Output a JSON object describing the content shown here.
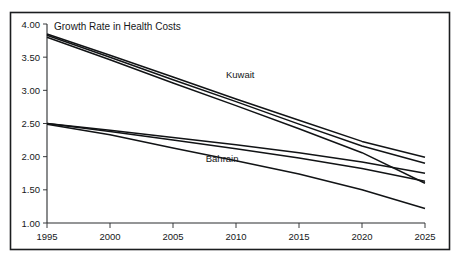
{
  "figure": {
    "title": "Growth Rate in Health Costs",
    "frame": {
      "border_color": "#1b1d1f"
    },
    "labels": {
      "kuwait": "Kuwait",
      "bahrain": "Bahrain"
    }
  },
  "chart_data": {
    "type": "line",
    "title": "Growth Rate in Health Costs",
    "xlabel": "",
    "ylabel": "",
    "xlim": [
      1995,
      2025
    ],
    "ylim": [
      1.0,
      4.0
    ],
    "grid": false,
    "legend": "inline-annotations",
    "x": [
      1995,
      2000,
      2005,
      2010,
      2015,
      2020,
      2025
    ],
    "xticklabels": [
      "1995",
      "2000",
      "2005",
      "2010",
      "2015",
      "2020",
      "2025"
    ],
    "yticks": [
      1.0,
      1.5,
      2.0,
      2.5,
      3.0,
      3.5,
      4.0
    ],
    "yticklabels": [
      "1.00",
      "1.50",
      "2.00",
      "2.50",
      "3.00",
      "3.50",
      "4.00"
    ],
    "annotations": [
      {
        "text": "Kuwait",
        "x": 2009.2,
        "y": 3.18
      },
      {
        "text": "Bahrain",
        "x": 2007.6,
        "y": 1.92
      }
    ],
    "series": [
      {
        "name": "Kuwait upper",
        "group": "Kuwait",
        "values": [
          3.85,
          3.53,
          3.2,
          2.87,
          2.55,
          2.23,
          1.99
        ]
      },
      {
        "name": "Kuwait middle",
        "group": "Kuwait",
        "values": [
          3.83,
          3.5,
          3.16,
          2.83,
          2.49,
          2.16,
          1.9
        ]
      },
      {
        "name": "Kuwait lower",
        "group": "Kuwait",
        "values": [
          3.8,
          3.46,
          3.11,
          2.77,
          2.42,
          2.06,
          1.6
        ]
      },
      {
        "name": "Bahrain upper",
        "group": "Bahrain",
        "values": [
          2.5,
          2.4,
          2.29,
          2.18,
          2.06,
          1.92,
          1.75
        ]
      },
      {
        "name": "Bahrain middle",
        "group": "Bahrain",
        "values": [
          2.5,
          2.38,
          2.25,
          2.12,
          1.98,
          1.82,
          1.63
        ]
      },
      {
        "name": "Bahrain lower",
        "group": "Bahrain",
        "values": [
          2.49,
          2.33,
          2.13,
          1.94,
          1.74,
          1.5,
          1.22
        ]
      }
    ]
  }
}
